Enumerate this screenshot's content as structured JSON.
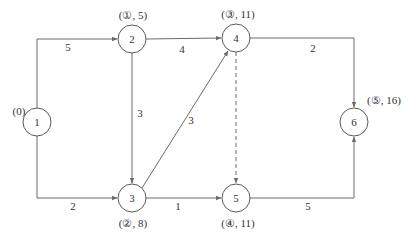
{
  "diagram": {
    "type": "network-graph",
    "nodes": [
      {
        "id": "1",
        "label": "1",
        "x": 37,
        "y": 122,
        "annotation": "(0)"
      },
      {
        "id": "2",
        "label": "2",
        "x": 132,
        "y": 39,
        "annotation": "(①, 5)"
      },
      {
        "id": "3",
        "label": "3",
        "x": 132,
        "y": 198,
        "annotation": "(②, 8)"
      },
      {
        "id": "4",
        "label": "4",
        "x": 236,
        "y": 38,
        "annotation": "(③, 11)"
      },
      {
        "id": "5",
        "label": "5",
        "x": 236,
        "y": 198,
        "annotation": "(④, 11)"
      },
      {
        "id": "6",
        "label": "6",
        "x": 354,
        "y": 122,
        "annotation": "(⑤, 16)"
      }
    ],
    "edges": [
      {
        "from": "1",
        "to": "2",
        "weight": "5",
        "style": "solid"
      },
      {
        "from": "1",
        "to": "3",
        "weight": "2",
        "style": "solid"
      },
      {
        "from": "2",
        "to": "4",
        "weight": "4",
        "style": "solid"
      },
      {
        "from": "2",
        "to": "3",
        "weight": "3",
        "style": "solid"
      },
      {
        "from": "3",
        "to": "4",
        "weight": "3",
        "style": "solid"
      },
      {
        "from": "3",
        "to": "5",
        "weight": "1",
        "style": "solid"
      },
      {
        "from": "4",
        "to": "6",
        "weight": "2",
        "style": "solid"
      },
      {
        "from": "4",
        "to": "5",
        "weight": "",
        "style": "dashed"
      },
      {
        "from": "5",
        "to": "6",
        "weight": "5",
        "style": "solid"
      }
    ]
  }
}
